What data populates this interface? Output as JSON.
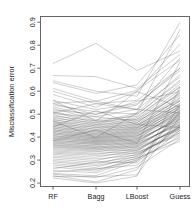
{
  "chart_data": {
    "type": "line",
    "plot_style": "parallel-coordinates",
    "title": "",
    "subtitle": "",
    "xlabel": "",
    "ylabel": "Misclassification error",
    "categories": [
      "RF",
      "Bagg",
      "LBoost",
      "Guess"
    ],
    "xtick_labels": [
      "RF",
      "Bagg",
      "LBoost",
      "Guess"
    ],
    "ytick_labels": [
      "0.2",
      "0.3",
      "0.4",
      "0.5",
      "0.6",
      "0.7",
      "0.8",
      "0.9"
    ],
    "ytick_values": [
      0.2,
      0.3,
      0.4,
      0.5,
      0.6,
      0.7,
      0.8,
      0.9
    ],
    "ylim": [
      0.185,
      0.925
    ],
    "xlim": [
      0.72,
      4.28
    ],
    "grid": false,
    "legend": null,
    "legend_position": "none",
    "annotations": [],
    "line_color": "#4d4d4d",
    "series": [
      {
        "name": "d1",
        "values": [
          0.72,
          0.808,
          0.69,
          0.775
        ]
      },
      {
        "name": "d2",
        "values": [
          0.668,
          0.663,
          0.612,
          0.76
        ]
      },
      {
        "name": "d3",
        "values": [
          0.645,
          0.6,
          0.578,
          0.9
        ]
      },
      {
        "name": "d4",
        "values": [
          0.637,
          0.59,
          0.628,
          0.845
        ]
      },
      {
        "name": "d5",
        "values": [
          0.612,
          0.556,
          0.604,
          0.735
        ]
      },
      {
        "name": "d6",
        "values": [
          0.6,
          0.545,
          0.56,
          0.7
        ]
      },
      {
        "name": "d7",
        "values": [
          0.585,
          0.53,
          0.598,
          0.805
        ]
      },
      {
        "name": "d8",
        "values": [
          0.56,
          0.52,
          0.545,
          0.69
        ]
      },
      {
        "name": "d9",
        "values": [
          0.548,
          0.556,
          0.52,
          0.662
        ]
      },
      {
        "name": "d10",
        "values": [
          0.546,
          0.498,
          0.556,
          0.598
        ]
      },
      {
        "name": "d11",
        "values": [
          0.54,
          0.51,
          0.5,
          0.64
        ]
      },
      {
        "name": "d12",
        "values": [
          0.532,
          0.489,
          0.522,
          0.745
        ]
      },
      {
        "name": "d13",
        "values": [
          0.525,
          0.476,
          0.49,
          0.62
        ]
      },
      {
        "name": "d14",
        "values": [
          0.518,
          0.5,
          0.54,
          0.7
        ]
      },
      {
        "name": "d15",
        "values": [
          0.512,
          0.47,
          0.478,
          0.585
        ]
      },
      {
        "name": "d16",
        "values": [
          0.508,
          0.462,
          0.505,
          0.672
        ]
      },
      {
        "name": "d17",
        "values": [
          0.502,
          0.488,
          0.47,
          0.56
        ]
      },
      {
        "name": "d18",
        "values": [
          0.498,
          0.455,
          0.498,
          0.648
        ]
      },
      {
        "name": "d19",
        "values": [
          0.492,
          0.47,
          0.462,
          0.595
        ]
      },
      {
        "name": "d20",
        "values": [
          0.488,
          0.448,
          0.485,
          0.63
        ]
      },
      {
        "name": "d21",
        "values": [
          0.482,
          0.462,
          0.455,
          0.54
        ]
      },
      {
        "name": "d22",
        "values": [
          0.478,
          0.44,
          0.478,
          0.618
        ]
      },
      {
        "name": "d23",
        "values": [
          0.474,
          0.455,
          0.448,
          0.572
        ]
      },
      {
        "name": "d24",
        "values": [
          0.47,
          0.432,
          0.47,
          0.605
        ]
      },
      {
        "name": "d25",
        "values": [
          0.466,
          0.448,
          0.442,
          0.53
        ]
      },
      {
        "name": "d26",
        "values": [
          0.462,
          0.425,
          0.462,
          0.592
        ]
      },
      {
        "name": "d27",
        "values": [
          0.458,
          0.442,
          0.438,
          0.558
        ]
      },
      {
        "name": "d28",
        "values": [
          0.455,
          0.418,
          0.455,
          0.58
        ]
      },
      {
        "name": "d29",
        "values": [
          0.452,
          0.435,
          0.432,
          0.522
        ]
      },
      {
        "name": "d30",
        "values": [
          0.448,
          0.412,
          0.448,
          0.568
        ]
      },
      {
        "name": "d31",
        "values": [
          0.444,
          0.428,
          0.426,
          0.548
        ]
      },
      {
        "name": "d32",
        "values": [
          0.441,
          0.405,
          0.442,
          0.558
        ]
      },
      {
        "name": "d33",
        "values": [
          0.438,
          0.422,
          0.42,
          0.512
        ]
      },
      {
        "name": "d34",
        "values": [
          0.434,
          0.4,
          0.436,
          0.545
        ]
      },
      {
        "name": "d35",
        "values": [
          0.431,
          0.415,
          0.414,
          0.538
        ]
      },
      {
        "name": "d36",
        "values": [
          0.428,
          0.396,
          0.43,
          0.535
        ]
      },
      {
        "name": "d37",
        "values": [
          0.425,
          0.41,
          0.408,
          0.5
        ]
      },
      {
        "name": "d38",
        "values": [
          0.421,
          0.392,
          0.424,
          0.525
        ]
      },
      {
        "name": "d39",
        "values": [
          0.418,
          0.404,
          0.402,
          0.528
        ]
      },
      {
        "name": "d40",
        "values": [
          0.415,
          0.388,
          0.418,
          0.515
        ]
      },
      {
        "name": "d41",
        "values": [
          0.412,
          0.398,
          0.396,
          0.492
        ]
      },
      {
        "name": "d42",
        "values": [
          0.408,
          0.384,
          0.412,
          0.505
        ]
      },
      {
        "name": "d43",
        "values": [
          0.405,
          0.392,
          0.39,
          0.518
        ]
      },
      {
        "name": "d44",
        "values": [
          0.402,
          0.38,
          0.406,
          0.496
        ]
      },
      {
        "name": "d45",
        "values": [
          0.398,
          0.386,
          0.384,
          0.482
        ]
      },
      {
        "name": "d46",
        "values": [
          0.395,
          0.376,
          0.4,
          0.508
        ]
      },
      {
        "name": "d47",
        "values": [
          0.392,
          0.38,
          0.378,
          0.488
        ]
      },
      {
        "name": "d48",
        "values": [
          0.388,
          0.372,
          0.394,
          0.472
        ]
      },
      {
        "name": "d49",
        "values": [
          0.385,
          0.374,
          0.372,
          0.498
        ]
      },
      {
        "name": "d50",
        "values": [
          0.382,
          0.368,
          0.388,
          0.478
        ]
      },
      {
        "name": "d51",
        "values": [
          0.378,
          0.368,
          0.366,
          0.462
        ]
      },
      {
        "name": "d52",
        "values": [
          0.375,
          0.362,
          0.382,
          0.488
        ]
      },
      {
        "name": "d53",
        "values": [
          0.372,
          0.36,
          0.36,
          0.468
        ]
      },
      {
        "name": "d54",
        "values": [
          0.368,
          0.356,
          0.376,
          0.452
        ]
      },
      {
        "name": "d55",
        "values": [
          0.365,
          0.354,
          0.354,
          0.478
        ]
      },
      {
        "name": "d56",
        "values": [
          0.362,
          0.35,
          0.37,
          0.458
        ]
      },
      {
        "name": "d57",
        "values": [
          0.358,
          0.348,
          0.348,
          0.442
        ]
      },
      {
        "name": "d58",
        "values": [
          0.355,
          0.344,
          0.364,
          0.468
        ]
      },
      {
        "name": "d59",
        "values": [
          0.35,
          0.34,
          0.342,
          0.448
        ]
      },
      {
        "name": "d60",
        "values": [
          0.345,
          0.336,
          0.358,
          0.432
        ]
      },
      {
        "name": "d61",
        "values": [
          0.34,
          0.33,
          0.336,
          0.455
        ]
      },
      {
        "name": "d62",
        "values": [
          0.335,
          0.325,
          0.35,
          0.438
        ]
      },
      {
        "name": "d63",
        "values": [
          0.33,
          0.32,
          0.33,
          0.42
        ]
      },
      {
        "name": "d64",
        "values": [
          0.325,
          0.312,
          0.342,
          0.445
        ]
      },
      {
        "name": "d65",
        "values": [
          0.318,
          0.305,
          0.322,
          0.428
        ]
      },
      {
        "name": "d66",
        "values": [
          0.312,
          0.298,
          0.334,
          0.41
        ]
      },
      {
        "name": "d67",
        "values": [
          0.305,
          0.29,
          0.314,
          0.438
        ]
      },
      {
        "name": "d68",
        "values": [
          0.298,
          0.282,
          0.326,
          0.418
        ]
      },
      {
        "name": "d69",
        "values": [
          0.292,
          0.276,
          0.306,
          0.398
        ]
      },
      {
        "name": "d70",
        "values": [
          0.285,
          0.268,
          0.318,
          0.445
        ]
      },
      {
        "name": "d71",
        "values": [
          0.278,
          0.26,
          0.298,
          0.405
        ]
      },
      {
        "name": "d72",
        "values": [
          0.27,
          0.252,
          0.31,
          0.382
        ]
      },
      {
        "name": "d73",
        "values": [
          0.262,
          0.292,
          0.288,
          0.452
        ]
      },
      {
        "name": "d74",
        "values": [
          0.255,
          0.245,
          0.302,
          0.512
        ]
      },
      {
        "name": "d75",
        "values": [
          0.248,
          0.262,
          0.278,
          0.43
        ]
      },
      {
        "name": "d76",
        "values": [
          0.242,
          0.232,
          0.294,
          0.505
        ]
      },
      {
        "name": "d77",
        "values": [
          0.238,
          0.224,
          0.268,
          0.392
        ]
      },
      {
        "name": "d78",
        "values": [
          0.232,
          0.205,
          0.258,
          0.54
        ]
      },
      {
        "name": "d79",
        "values": [
          0.228,
          0.228,
          0.236,
          0.488
        ]
      },
      {
        "name": "d80",
        "values": [
          0.222,
          0.2,
          0.23,
          0.618
        ]
      },
      {
        "name": "d81",
        "values": [
          0.505,
          0.545,
          0.52,
          0.505
        ]
      },
      {
        "name": "d82",
        "values": [
          0.56,
          0.47,
          0.598,
          0.53
        ]
      },
      {
        "name": "d83",
        "values": [
          0.445,
          0.515,
          0.455,
          0.442
        ]
      },
      {
        "name": "d84",
        "values": [
          0.385,
          0.43,
          0.372,
          0.728
        ]
      },
      {
        "name": "d85",
        "values": [
          0.47,
          0.398,
          0.505,
          0.868
        ]
      }
    ]
  },
  "axes": {
    "y_axis_title": "Misclassification error",
    "x_axis_title": ""
  }
}
